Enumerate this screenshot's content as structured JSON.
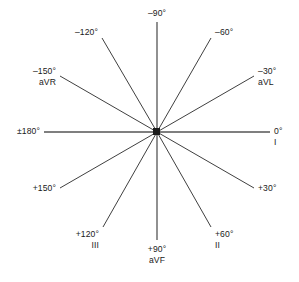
{
  "diagram": {
    "name": "Hexaxial reference system",
    "center": {
      "x": 157,
      "y": 132
    },
    "line_color": "#404040",
    "text_color": "#1a1a1a",
    "background": "#ffffff",
    "axes": [
      {
        "id": "minus-90",
        "degrees": "–90°",
        "lead": "",
        "x1": 157,
        "y1": 132,
        "x2": 157,
        "y2": 22,
        "label_x": 157,
        "label_y": 8,
        "align": "center"
      },
      {
        "id": "minus-120",
        "degrees": "–120°",
        "lead": "",
        "x1": 157,
        "y1": 132,
        "x2": 102,
        "y2": 38,
        "label_x": 98,
        "label_y": 27,
        "align": "right"
      },
      {
        "id": "minus-150-avr",
        "degrees": "–150°",
        "lead": "aVR",
        "x1": 157,
        "y1": 132,
        "x2": 60,
        "y2": 76,
        "label_x": 56,
        "label_y": 66,
        "align": "right"
      },
      {
        "id": "plus-minus-180",
        "degrees": "±180°",
        "lead": "",
        "x1": 157,
        "y1": 132,
        "x2": 44,
        "y2": 132,
        "label_x": 40,
        "label_y": 126,
        "align": "right"
      },
      {
        "id": "plus-150",
        "degrees": "+150°",
        "lead": "",
        "x1": 157,
        "y1": 132,
        "x2": 60,
        "y2": 188,
        "label_x": 56,
        "label_y": 183,
        "align": "right"
      },
      {
        "id": "plus-120-iii",
        "degrees": "+120°",
        "lead": "III",
        "x1": 157,
        "y1": 132,
        "x2": 103,
        "y2": 227,
        "label_x": 99,
        "label_y": 229,
        "align": "right"
      },
      {
        "id": "plus-90-avf",
        "degrees": "+90°",
        "lead": "aVF",
        "x1": 157,
        "y1": 132,
        "x2": 157,
        "y2": 240,
        "label_x": 157,
        "label_y": 244,
        "align": "center"
      },
      {
        "id": "plus-60-ii",
        "degrees": "+60°",
        "lead": "II",
        "x1": 157,
        "y1": 132,
        "x2": 211,
        "y2": 227,
        "label_x": 215,
        "label_y": 229,
        "align": "left"
      },
      {
        "id": "plus-30",
        "degrees": "+30°",
        "lead": "",
        "x1": 157,
        "y1": 132,
        "x2": 254,
        "y2": 188,
        "label_x": 258,
        "label_y": 183,
        "align": "left"
      },
      {
        "id": "zero-i",
        "degrees": "0°",
        "lead": "I",
        "x1": 157,
        "y1": 132,
        "x2": 270,
        "y2": 132,
        "label_x": 274,
        "label_y": 126,
        "align": "left"
      },
      {
        "id": "minus-30-avl",
        "degrees": "–30°",
        "lead": "aVL",
        "x1": 157,
        "y1": 132,
        "x2": 254,
        "y2": 76,
        "label_x": 258,
        "label_y": 66,
        "align": "left"
      },
      {
        "id": "minus-60",
        "degrees": "–60°",
        "lead": "",
        "x1": 157,
        "y1": 132,
        "x2": 211,
        "y2": 38,
        "label_x": 215,
        "label_y": 27,
        "align": "left"
      }
    ]
  }
}
